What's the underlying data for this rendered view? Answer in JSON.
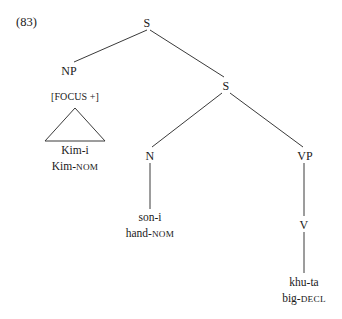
{
  "example": {
    "number": "(83)"
  },
  "tree": {
    "nodes": {
      "root_s": "S",
      "np": "NP",
      "embedded_s": "S",
      "n": "N",
      "vp": "VP",
      "v": "V"
    },
    "feature_label": "[FOCUS +]",
    "terminals": {
      "subject": {
        "form": "Kim-i",
        "gloss_stem": "Kim-",
        "gloss_case": "NOM"
      },
      "possessum": {
        "form": "son-i",
        "gloss_stem": "hand-",
        "gloss_case": "NOM"
      },
      "predicate": {
        "form": "khu-ta",
        "gloss_stem": "big-",
        "gloss_case": "DECL"
      }
    }
  },
  "colors": {
    "ink": "#1a1a1a",
    "line": "#3a3a3a",
    "background": "#ffffff"
  }
}
